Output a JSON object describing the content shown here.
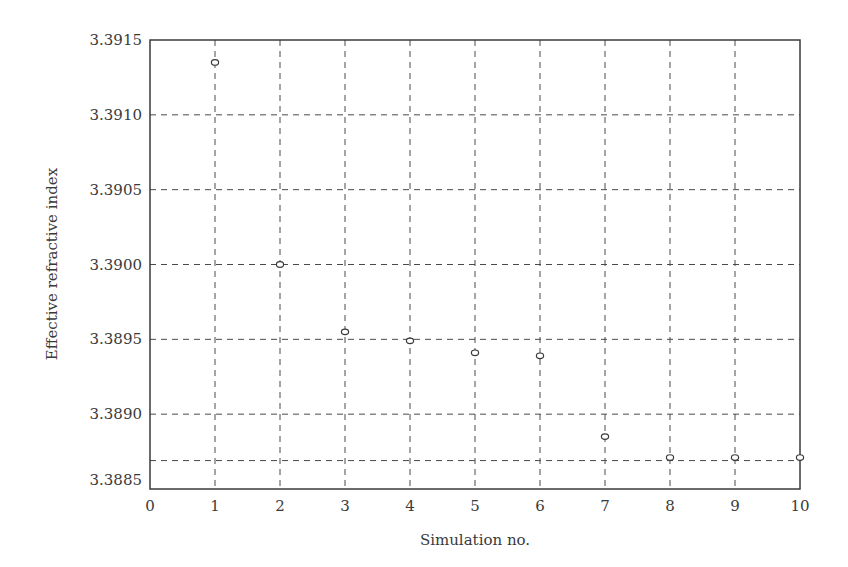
{
  "chart_data": {
    "type": "scatter",
    "title": "",
    "xlabel": "Simulation no.",
    "ylabel": "Effective refractive index",
    "x": [
      1,
      2,
      3,
      4,
      5,
      6,
      7,
      8,
      9,
      10
    ],
    "series": [
      {
        "name": "Effective refractive index",
        "marker": "open-circle",
        "values": [
          3.39135,
          3.39,
          3.38955,
          3.38949,
          3.38941,
          3.38939,
          3.38885,
          3.38871,
          3.38871,
          3.38871
        ]
      }
    ],
    "xlim": [
      0,
      10
    ],
    "ylim": [
      3.3885,
      3.3915
    ],
    "xticks": [
      "0",
      "1",
      "2",
      "3",
      "4",
      "5",
      "6",
      "7",
      "8",
      "9",
      "10"
    ],
    "yticks": [
      "3.3885",
      "3.3890",
      "3.3895",
      "3.3900",
      "3.3905",
      "3.3910",
      "3.3915"
    ],
    "grid": true,
    "grid_style": "dashed",
    "extra_hline": 3.38869,
    "legend": null
  },
  "colors": {
    "axis": "#3a3a3a",
    "grid": "#4a4a4a",
    "marker": "#3a3a3a",
    "background": "#ffffff"
  }
}
